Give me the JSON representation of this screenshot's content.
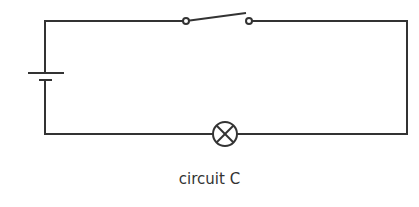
{
  "diagram": {
    "type": "circuit",
    "caption": "circuit C",
    "colors": {
      "wire": "#333333",
      "background": "#ffffff"
    },
    "components": [
      {
        "kind": "battery",
        "label": "cell",
        "orientation": "vertical"
      },
      {
        "kind": "switch",
        "state": "open"
      },
      {
        "kind": "lamp",
        "symbol": "circle-with-cross"
      }
    ],
    "connections": "series loop"
  }
}
